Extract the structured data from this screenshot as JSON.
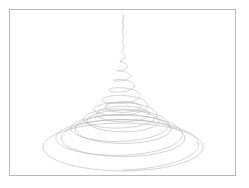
{
  "figure": {
    "title": "",
    "background_color": "#ffffff",
    "frame": {
      "border_color": "#b8b8b8",
      "fill_color": "#ffffff",
      "x": 9,
      "y": 9,
      "width": 227,
      "height": 167
    }
  },
  "chart_data": {
    "type": "line",
    "title": "",
    "subtitle": "",
    "xlabel": "",
    "ylabel": "",
    "grid": false,
    "legend": null,
    "axes_visible": false,
    "tick_labels": [],
    "line_color": "#b4b4b4",
    "line_width": 0.6,
    "projection": {
      "type": "perspective-oblique",
      "ellipse_flatten_ratio": 0.3,
      "apex_screen_x": 113,
      "apex_screen_y": 5,
      "base_center_screen_x": 113,
      "base_center_screen_y": 136
    },
    "parametric": {
      "equation": "r(t) = A * t^p ; x = cx + r cos(2*pi*f*t) ; y = y0 + t*(y1-y0) + k * r * sin(2*pi*f*t)",
      "t_range": [
        0,
        1
      ],
      "turns": 13.5,
      "radius_exponent": 3.1,
      "max_radius": 80,
      "samples": 2600
    },
    "series": [
      {
        "name": "conical-helix",
        "turns": 13.5,
        "radius_exponent": 3.1,
        "max_radius": 80
      }
    ],
    "base_rings": [
      {
        "name": "ring-1",
        "cx": 113,
        "cy": 97,
        "rx": 18,
        "ry": 5.4
      },
      {
        "name": "ring-2",
        "cx": 113,
        "cy": 104,
        "rx": 26,
        "ry": 7.8
      },
      {
        "name": "ring-3",
        "cx": 113,
        "cy": 111,
        "rx": 36,
        "ry": 10.8
      },
      {
        "name": "ring-4",
        "cx": 113,
        "cy": 119,
        "rx": 48,
        "ry": 14.4
      },
      {
        "name": "ring-5",
        "cx": 113,
        "cy": 128,
        "rx": 62,
        "ry": 18.6
      },
      {
        "name": "ring-6",
        "cx": 113,
        "cy": 137,
        "rx": 80,
        "ry": 24.0
      }
    ],
    "xlim": [
      0,
      227
    ],
    "ylim": [
      0,
      167
    ]
  }
}
